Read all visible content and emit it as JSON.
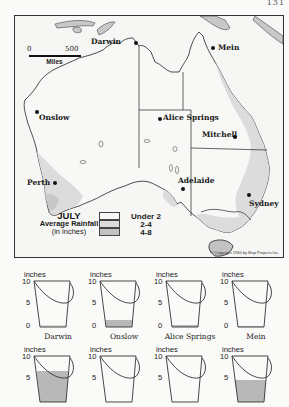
{
  "page_number": "131",
  "map": {
    "title": "JULY",
    "subtitle": "Average Rainfall",
    "unit_note": "(in inches)",
    "scale": {
      "start": "0",
      "end": "500",
      "unit": "Miles"
    },
    "legend": [
      {
        "label": "Under 2",
        "color": "#f8f8f6"
      },
      {
        "label": "2-4",
        "color": "#dcdcdc"
      },
      {
        "label": "4-8",
        "color": "#c2c2c2"
      }
    ],
    "copyright": "© Copyright 1960 by Map Projects Inc.",
    "cities": [
      {
        "name": "Darwin",
        "x": 102,
        "y": 26
      },
      {
        "name": "Mein",
        "x": 198,
        "y": 32
      },
      {
        "name": "Onslow",
        "x": 22,
        "y": 96
      },
      {
        "name": "Alice Springs",
        "x": 145,
        "y": 101
      },
      {
        "name": "Mitchell",
        "x": 218,
        "y": 119
      },
      {
        "name": "Perth",
        "x": 39,
        "y": 167
      },
      {
        "name": "Adelaide",
        "x": 167,
        "y": 171
      },
      {
        "name": "Sydney",
        "x": 233,
        "y": 178
      }
    ]
  },
  "buckets": {
    "unit_label": "inches",
    "ticks": [
      "10",
      "5",
      "0"
    ],
    "items": [
      {
        "city": "Darwin",
        "rainfall_in": 0.1
      },
      {
        "city": "Onslow",
        "rainfall_in": 1.2
      },
      {
        "city": "Alice Springs",
        "rainfall_in": 0.4
      },
      {
        "city": "Mein",
        "rainfall_in": 0.2
      },
      {
        "city": "Perth",
        "rainfall_in": 6.7
      },
      {
        "city": "Adelaide",
        "rainfall_in": 2.6
      },
      {
        "city": "Mitchell",
        "rainfall_in": 1.1
      },
      {
        "city": "Sydney",
        "rainfall_in": 4.6
      }
    ]
  }
}
